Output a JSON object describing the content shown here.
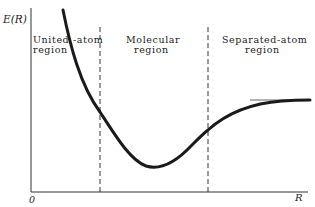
{
  "diagram": {
    "axes": {
      "y_label": "E(R)",
      "x_label": "R",
      "origin_label": "0"
    },
    "regions": [
      {
        "line1": "United -atom",
        "line2": "region"
      },
      {
        "line1": "Molecular",
        "line2": "region"
      },
      {
        "line1": "Separated-atom",
        "line2": "region"
      }
    ],
    "dividers": [
      "dashed-boundary-united-molecular",
      "dashed-boundary-molecular-separated"
    ],
    "curve": {
      "description": "Energy curve decreasing steeply at small R, reaching a minimum in the molecular region, then rising to approach a horizontal asymptote at large R",
      "asymptote": "separated-atom energy limit"
    },
    "colors": {
      "curve": "#1a1a1a",
      "axes": "#333333",
      "dashed": "#333333",
      "asymptote": "#555555",
      "text": "#222222",
      "background": "#ffffff"
    }
  }
}
